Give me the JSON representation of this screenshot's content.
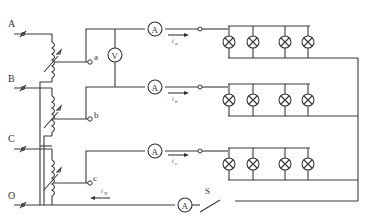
{
  "diagram": {
    "type": "three-phase four-wire lamp load circuit with variable autotransformers",
    "terminals": [
      {
        "label": "A",
        "y": 34
      },
      {
        "label": "B",
        "y": 88
      },
      {
        "label": "C",
        "y": 149
      },
      {
        "label": "O",
        "y": 205
      }
    ],
    "taps": [
      {
        "label": "a"
      },
      {
        "label": "b"
      },
      {
        "label": "c"
      }
    ],
    "voltmeter": {
      "label": "V"
    },
    "ammeters": [
      {
        "label": "A",
        "phase": "a"
      },
      {
        "label": "A",
        "phase": "b"
      },
      {
        "label": "A",
        "phase": "c"
      },
      {
        "label": "A",
        "phase": "neutral"
      }
    ],
    "currents": [
      {
        "label": "i",
        "sub": "a"
      },
      {
        "label": "i",
        "sub": "b"
      },
      {
        "label": "i",
        "sub": "c"
      },
      {
        "label": "i",
        "sub": "N"
      }
    ],
    "switch": {
      "label": "S"
    },
    "lamp_banks": [
      {
        "phase": "a",
        "lamps": 4
      },
      {
        "phase": "b",
        "lamps": 4
      },
      {
        "phase": "c",
        "lamps": 4
      }
    ]
  }
}
